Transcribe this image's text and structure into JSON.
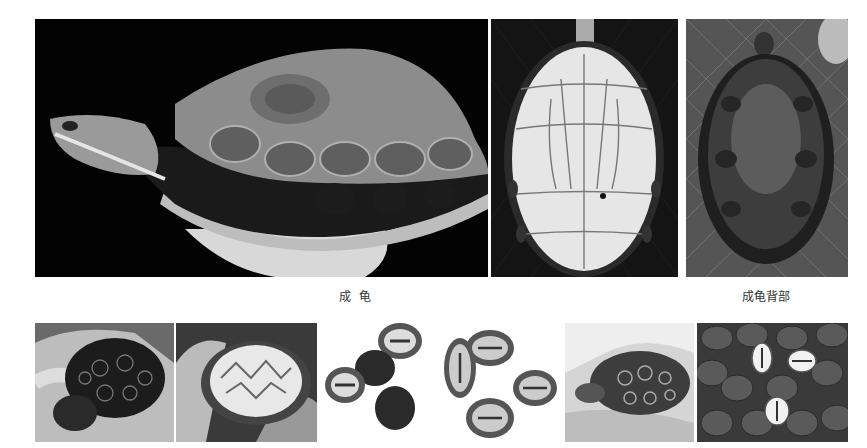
{
  "top_row": {
    "photos": [
      {
        "id": "adult-side",
        "subject": "adult turtle side view held in hand",
        "bg": "#000000"
      },
      {
        "id": "adult-plastron",
        "subject": "adult turtle plastron (underside)",
        "bg": "#111111"
      },
      {
        "id": "adult-carapace",
        "subject": "adult turtle carapace on net",
        "bg": "#4a4a4a"
      }
    ],
    "captions": [
      {
        "text": "成  龟"
      },
      {
        "text": "成龟背部"
      }
    ]
  },
  "bottom_row": {
    "photos": [
      {
        "id": "juvenile-top-hand",
        "subject": "juvenile turtle carapace in hand"
      },
      {
        "id": "juvenile-under-hand",
        "subject": "juvenile turtle plastron in hand"
      },
      {
        "id": "hatchlings-group-1",
        "subject": "hatchlings on white background"
      },
      {
        "id": "hatchlings-group-2",
        "subject": "hatchlings plastrons on white background"
      },
      {
        "id": "juvenile-side-hand",
        "subject": "juvenile turtle side view in hand"
      },
      {
        "id": "hatchlings-pile",
        "subject": "many hatchlings piled together"
      }
    ]
  }
}
